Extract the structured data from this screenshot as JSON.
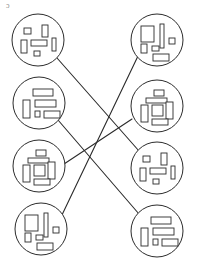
{
  "diagram": {
    "type": "matching-puzzle",
    "canvas": {
      "width": 197,
      "height": 273,
      "background": "#ffffff"
    },
    "style": {
      "circle_stroke": "#2b2b2b",
      "circle_fill": "#ffffff",
      "circle_stroke_width": 1,
      "rect_stroke": "#2b2b2b",
      "rect_fill": "#ffffff",
      "rect_stroke_width": 0.9,
      "line_stroke": "#2b2b2b",
      "line_stroke_width": 1.1
    },
    "stray_mark": "ɔ",
    "patterns": {
      "small-scatter": {
        "name": "small-scatter",
        "rects": [
          {
            "x": -14,
            "y": -12,
            "w": 7,
            "h": 6
          },
          {
            "x": 4,
            "y": -15,
            "w": 6,
            "h": 12
          },
          {
            "x": -17,
            "y": 0,
            "w": 6,
            "h": 13
          },
          {
            "x": -7,
            "y": 0,
            "w": 16,
            "h": 6
          },
          {
            "x": 14,
            "y": -2,
            "w": 4,
            "h": 13
          },
          {
            "x": -4,
            "y": 11,
            "w": 6,
            "h": 5
          }
        ]
      },
      "stacked-bars": {
        "name": "stacked-bars",
        "rects": [
          {
            "x": -6,
            "y": -14,
            "w": 20,
            "h": 7
          },
          {
            "x": -16,
            "y": -3,
            "w": 7,
            "h": 18
          },
          {
            "x": -4,
            "y": -3,
            "w": 21,
            "h": 7
          },
          {
            "x": -4,
            "y": 8,
            "w": 5,
            "h": 6
          },
          {
            "x": 5,
            "y": 8,
            "w": 16,
            "h": 7
          }
        ]
      },
      "vertical-cluster": {
        "name": "vertical-cluster",
        "rects": [
          {
            "x": -3,
            "y": -16,
            "w": 10,
            "h": 6
          },
          {
            "x": -11,
            "y": -8,
            "w": 21,
            "h": 5
          },
          {
            "x": -16,
            "y": -1,
            "w": 7,
            "h": 17
          },
          {
            "x": -5,
            "y": -1,
            "w": 11,
            "h": 11
          },
          {
            "x": 9,
            "y": -4,
            "w": 7,
            "h": 17
          },
          {
            "x": -5,
            "y": 13,
            "w": 16,
            "h": 6
          }
        ]
      },
      "big-block-bar": {
        "name": "big-block-bar",
        "rects": [
          {
            "x": -16,
            "y": -14,
            "w": 13,
            "h": 16
          },
          {
            "x": 3,
            "y": -16,
            "w": 4,
            "h": 24
          },
          {
            "x": 12,
            "y": -2,
            "w": 6,
            "h": 6
          },
          {
            "x": -16,
            "y": 4,
            "w": 6,
            "h": 9
          },
          {
            "x": -5,
            "y": 6,
            "w": 7,
            "h": 5
          },
          {
            "x": -4,
            "y": 14,
            "w": 16,
            "h": 7
          }
        ]
      }
    },
    "left_column": [
      {
        "id": "left-1",
        "label": "Left circle 1",
        "cx": 38,
        "cy": 40,
        "r": 26,
        "pattern": "small-scatter"
      },
      {
        "id": "left-2",
        "label": "Left circle 2",
        "cx": 39,
        "cy": 103,
        "r": 26,
        "pattern": "stacked-bars"
      },
      {
        "id": "left-3",
        "label": "Left circle 3",
        "cx": 39,
        "cy": 166,
        "r": 26,
        "pattern": "vertical-cluster"
      },
      {
        "id": "left-4",
        "label": "Left circle 4",
        "cx": 41,
        "cy": 229,
        "r": 26,
        "pattern": "big-block-bar"
      }
    ],
    "right_column": [
      {
        "id": "right-1",
        "label": "Right circle 1",
        "cx": 157,
        "cy": 40,
        "r": 26,
        "pattern": "big-block-bar"
      },
      {
        "id": "right-2",
        "label": "Right circle 2",
        "cx": 157,
        "cy": 106,
        "r": 26,
        "pattern": "vertical-cluster"
      },
      {
        "id": "right-3",
        "label": "Right circle 3",
        "cx": 157,
        "cy": 168,
        "r": 26,
        "pattern": "small-scatter"
      },
      {
        "id": "right-4",
        "label": "Right circle 4",
        "cx": 157,
        "cy": 231,
        "r": 26,
        "pattern": "stacked-bars"
      }
    ],
    "connections": [
      {
        "id": "conn-1",
        "from": "left-1",
        "to": "right-3",
        "x1": 57,
        "y1": 58,
        "x2": 139,
        "y2": 151
      },
      {
        "id": "conn-2",
        "from": "left-2",
        "to": "right-4",
        "x1": 58,
        "y1": 120,
        "x2": 139,
        "y2": 214
      },
      {
        "id": "conn-3",
        "from": "left-3",
        "to": "right-2",
        "x1": 64,
        "y1": 164,
        "x2": 132,
        "y2": 119
      },
      {
        "id": "conn-4",
        "from": "left-4",
        "to": "right-1",
        "x1": 61,
        "y1": 217,
        "x2": 138,
        "y2": 56
      }
    ]
  }
}
